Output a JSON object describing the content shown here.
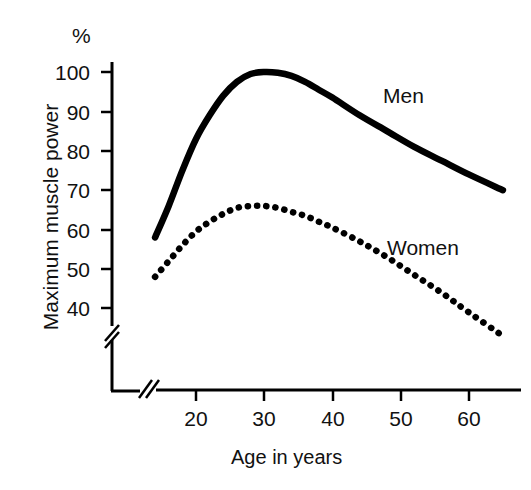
{
  "chart_data": {
    "type": "line",
    "title": "",
    "subtitle": "",
    "xlabel": "Age in years",
    "ylabel": "Maximum muscle power",
    "unit_symbol": "%",
    "xlim": [
      13,
      66
    ],
    "ylim": [
      30,
      104
    ],
    "x_ticks": [
      20,
      30,
      40,
      50,
      60
    ],
    "y_ticks": [
      40,
      50,
      60,
      70,
      80,
      90,
      100
    ],
    "x_axis_break": true,
    "y_axis_break": true,
    "grid": false,
    "legend_position": "inline-annotation",
    "series": [
      {
        "name": "Men",
        "style": "solid",
        "color": "#000000",
        "x": [
          14,
          16,
          18,
          20,
          22,
          24,
          26,
          28,
          30,
          32,
          34,
          36,
          38,
          40,
          44,
          48,
          52,
          56,
          60,
          65
        ],
        "values": [
          58,
          66,
          75,
          83,
          89,
          94,
          97.5,
          99.5,
          100,
          99.8,
          99,
          97.5,
          95.5,
          93.5,
          89,
          85,
          81,
          77.5,
          74,
          70
        ]
      },
      {
        "name": "Women",
        "style": "dotted",
        "color": "#000000",
        "x": [
          14,
          16,
          18,
          20,
          22,
          24,
          26,
          28,
          30,
          32,
          34,
          36,
          38,
          40,
          44,
          48,
          52,
          56,
          60,
          65
        ],
        "values": [
          48,
          52,
          56,
          59.5,
          62,
          64,
          65.5,
          66,
          66,
          65.5,
          64.5,
          63.5,
          62,
          60.5,
          57,
          53,
          48.5,
          44,
          39,
          33
        ]
      }
    ],
    "annotations": [
      {
        "text": "Men",
        "x": 52,
        "y": 97
      },
      {
        "text": "Women",
        "x": 50,
        "y": 70
      }
    ]
  },
  "axes": {
    "percent_symbol": "%",
    "y_title": "Maximum muscle power",
    "x_title": "Age in years",
    "y_tick_labels": [
      "100",
      "90",
      "80",
      "70",
      "60",
      "50",
      "40"
    ],
    "x_tick_labels": [
      "20",
      "30",
      "40",
      "50",
      "60"
    ]
  },
  "labels": {
    "men": "Men",
    "women": "Women"
  },
  "colors": {
    "ink": "#000000",
    "background": "#ffffff"
  }
}
